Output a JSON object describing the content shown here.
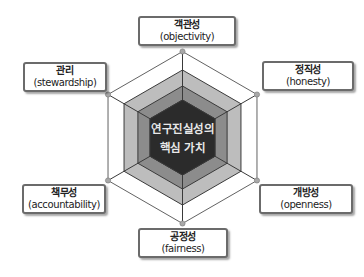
{
  "diagram": {
    "title_lines": [
      "연구진실성의",
      "핵심 가치"
    ],
    "center": {
      "x": 182.5,
      "y": 137.5
    },
    "layer_radii": [
      86,
      67.5,
      51.5,
      37.5
    ],
    "layer_colors": [
      "#ffffff",
      "#bdbdbd",
      "#8c8c8c",
      "#2b2b2b"
    ],
    "line_color": "#3a3a3a",
    "vertex_dot_color": "#a8a8a8",
    "values": [
      {
        "id": "objectivity",
        "ko": "객관성",
        "en": "(objectivity)",
        "position": "top"
      },
      {
        "id": "honesty",
        "ko": "정직성",
        "en": "(honesty)",
        "position": "upper-right"
      },
      {
        "id": "openness",
        "ko": "개방성",
        "en": "(openness)",
        "position": "lower-right"
      },
      {
        "id": "fairness",
        "ko": "공정성",
        "en": "(fairness)",
        "position": "bottom"
      },
      {
        "id": "accountability",
        "ko": "책무성",
        "en": "(accountability)",
        "position": "lower-left"
      },
      {
        "id": "stewardship",
        "ko": "관리",
        "en": "(stewardship)",
        "position": "upper-left"
      }
    ]
  }
}
